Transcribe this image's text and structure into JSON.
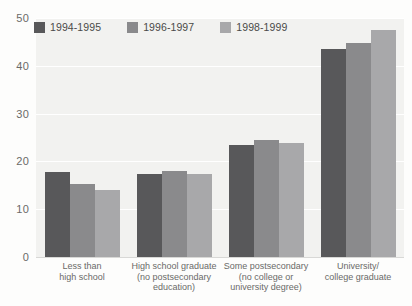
{
  "chart_data": {
    "type": "bar",
    "title": "",
    "xlabel": "",
    "ylabel": "",
    "ylim": [
      0,
      50
    ],
    "yticks": [
      0,
      10,
      20,
      30,
      40,
      50
    ],
    "grid": true,
    "legend_position": "top-left",
    "categories": [
      "Less than\nhigh school",
      "High school graduate\n(no postsecondary\neducation)",
      "Some postsecondary\n(no college or\nuniversity degree)",
      "University/\ncollege graduate"
    ],
    "series": [
      {
        "name": "1994-1995",
        "color": "#58585a",
        "values": [
          17.7,
          17.4,
          23.5,
          43.5
        ]
      },
      {
        "name": "1996-1997",
        "color": "#8a8a8c",
        "values": [
          15.3,
          17.9,
          24.4,
          44.8
        ]
      },
      {
        "name": "1998-1999",
        "color": "#a8a8aa",
        "values": [
          14.0,
          17.4,
          23.9,
          47.5
        ]
      }
    ]
  },
  "style": {
    "plot_background": "#f2f2f0",
    "gridline_color": "#ffffff",
    "tick_label_color": "#6a6a68"
  }
}
